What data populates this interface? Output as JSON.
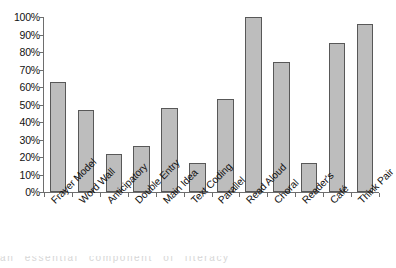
{
  "chart_data": {
    "type": "bar",
    "title": "",
    "subtitle": "",
    "xlabel": "",
    "ylabel": "",
    "ylim": [
      0,
      100
    ],
    "y_tick_labels": [
      "100%",
      "90%",
      "80%",
      "70%",
      "60%",
      "50%",
      "40%",
      "30%",
      "20%",
      "10%",
      "0%"
    ],
    "y_tick_values": [
      100,
      90,
      80,
      70,
      60,
      50,
      40,
      30,
      20,
      10,
      0
    ],
    "grid": false,
    "legend": false,
    "legend_position": "none",
    "bar_fill_color": "#bdbdbd",
    "bar_border_color": "#585858",
    "axis_color": "#6e6e6e",
    "categories": [
      "Frayer Model",
      "Word Wall",
      "Anticipatory",
      "Double Entry",
      "Main Idea",
      "Text Coding",
      "Parallel",
      "Read Aloud",
      "Choral",
      "Reader's",
      "Café",
      "Think Pair"
    ],
    "values": [
      63,
      47,
      22,
      26.5,
      48,
      16.5,
      53,
      100,
      74.5,
      16.5,
      85,
      96
    ],
    "value_unit": "%"
  },
  "page_bleed": {
    "text": "an essential component of literacy"
  }
}
